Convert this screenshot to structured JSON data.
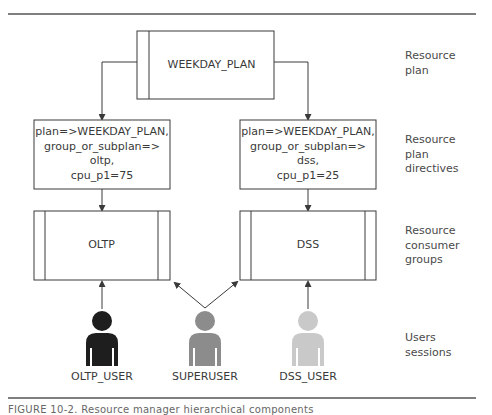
{
  "diagram": {
    "resource_plan": {
      "name": "WEEKDAY_PLAN"
    },
    "directives": [
      {
        "lines": [
          "plan=>WEEKDAY_PLAN,",
          "group_or_subplan=>",
          "oltp,",
          "cpu_p1=75"
        ]
      },
      {
        "lines": [
          "plan=>WEEKDAY_PLAN,",
          "group_or_subplan=>",
          "dss,",
          "cpu_p1=25"
        ]
      }
    ],
    "consumer_groups": [
      {
        "name": "OLTP"
      },
      {
        "name": "DSS"
      }
    ],
    "users": [
      {
        "name": "OLTP_USER",
        "color": "#1e1e1e"
      },
      {
        "name": "SUPERUSER",
        "color": "#8c8c8c"
      },
      {
        "name": "DSS_USER",
        "color": "#c9c9c9"
      }
    ],
    "level_labels": [
      {
        "lines": [
          "Resource",
          "plan"
        ]
      },
      {
        "lines": [
          "Resource",
          "plan",
          "directives"
        ]
      },
      {
        "lines": [
          "Resource",
          "consumer",
          "groups"
        ]
      },
      {
        "lines": [
          "Users",
          "sessions"
        ]
      }
    ],
    "caption": "FIGURE 10-2.   Resource manager hierarchical components"
  },
  "colors": {
    "line": "#3a3a3a",
    "text": "#3a3a3a"
  }
}
